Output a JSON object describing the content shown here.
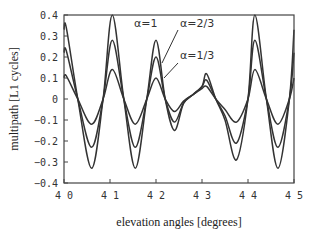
{
  "chart_data": {
    "type": "line",
    "title": "",
    "xlabel": "elevation angles [degrees]",
    "ylabel": "multipath [L1 cycles]",
    "xlim": [
      40,
      45
    ],
    "ylim": [
      -0.4,
      0.4
    ],
    "xticks": [
      "40",
      "41",
      "42",
      "43",
      "44",
      "45"
    ],
    "yticks": [
      "0.4",
      "0.3",
      "0.2",
      "0.1",
      "0",
      "-0.1",
      "-0.2",
      "-0.3",
      "-0.4"
    ],
    "grid": false,
    "legend": "inline annotations",
    "x": [
      40.0,
      40.05,
      40.3,
      40.6,
      40.85,
      41.05,
      41.3,
      41.55,
      41.8,
      42.0,
      42.2,
      42.4,
      42.6,
      42.8,
      43.0,
      43.1,
      43.3,
      43.5,
      43.75,
      44.0,
      44.15,
      44.4,
      44.65,
      44.9,
      45.0
    ],
    "series": [
      {
        "name": "α=1",
        "values": [
          0.33,
          0.34,
          0.0,
          -0.33,
          0.0,
          0.4,
          0.0,
          -0.33,
          0.0,
          0.28,
          0.0,
          -0.15,
          -0.02,
          0.02,
          0.06,
          0.12,
          0.0,
          -0.1,
          -0.29,
          0.0,
          0.4,
          0.0,
          -0.33,
          0.0,
          0.33
        ]
      },
      {
        "name": "α=2/3",
        "values": [
          0.22,
          0.23,
          0.0,
          -0.23,
          0.0,
          0.28,
          0.0,
          -0.23,
          0.0,
          0.2,
          0.0,
          -0.11,
          -0.02,
          0.02,
          0.06,
          0.09,
          0.0,
          -0.08,
          -0.21,
          0.0,
          0.28,
          0.0,
          -0.23,
          0.0,
          0.22
        ]
      },
      {
        "name": "α=1/3",
        "values": [
          0.1,
          0.11,
          0.0,
          -0.12,
          0.0,
          0.14,
          0.0,
          -0.12,
          0.0,
          0.1,
          0.0,
          -0.06,
          -0.01,
          0.02,
          0.05,
          0.06,
          0.0,
          -0.05,
          -0.11,
          0.0,
          0.14,
          0.0,
          -0.12,
          0.0,
          0.1
        ]
      }
    ],
    "annotations": [
      {
        "text": "α=1",
        "x": 41.55,
        "y": 0.355
      },
      {
        "text": "α=2/3",
        "x": 42.55,
        "y": 0.355
      },
      {
        "text": "α=1/3",
        "x": 42.55,
        "y": 0.2
      }
    ]
  },
  "labels": {
    "alpha_1": "α=1",
    "alpha_2_3": "α=2/3",
    "alpha_1_3": "α=1/3",
    "xlabel": "elevation angles [degrees]",
    "ylabel": "multipath [L1 cycles]"
  }
}
